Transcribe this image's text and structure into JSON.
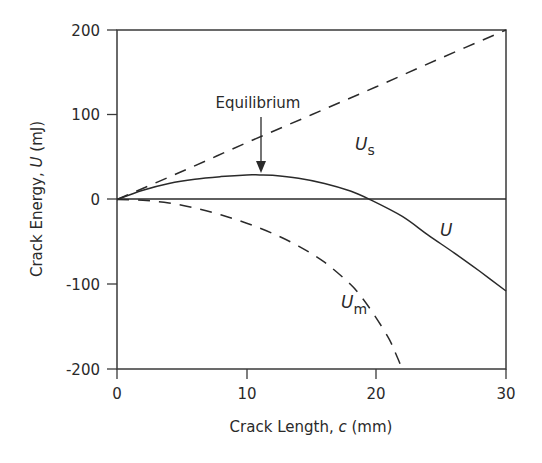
{
  "chart_data": {
    "type": "line",
    "title": "",
    "xlabel": "Crack Length, c (mm)",
    "ylabel": "Crack Energy, U (mJ)",
    "xlim": [
      0,
      30
    ],
    "ylim": [
      -200,
      200
    ],
    "xticks": [
      0,
      10,
      20,
      30
    ],
    "yticks": [
      200,
      100,
      0,
      -100,
      -200
    ],
    "grid": false,
    "legend": null,
    "series": [
      {
        "name": "U_s",
        "label_main": "U",
        "label_sub": "s",
        "style": "dashed",
        "x": [
          0,
          5,
          10,
          15,
          20,
          25,
          30
        ],
        "y": [
          0,
          33,
          67,
          100,
          133,
          167,
          200
        ]
      },
      {
        "name": "U",
        "label_main": "U",
        "label_sub": "",
        "style": "solid",
        "x": [
          0,
          2,
          4,
          6,
          8,
          10,
          11,
          12,
          14,
          16,
          18,
          19.5,
          22,
          24,
          26,
          28,
          30
        ],
        "y": [
          0,
          11,
          19,
          24,
          27,
          29,
          29,
          28.5,
          25,
          19,
          10,
          0,
          -20,
          -42,
          -63,
          -85,
          -108
        ]
      },
      {
        "name": "U_m",
        "label_main": "U",
        "label_sub": "m",
        "style": "dashed",
        "x": [
          0,
          2,
          4,
          6,
          8,
          10,
          12,
          14,
          16,
          18,
          19,
          20,
          21,
          21.5,
          22
        ],
        "y": [
          0,
          -1,
          -4,
          -10,
          -18,
          -28,
          -40,
          -55,
          -74,
          -100,
          -118,
          -140,
          -165,
          -182,
          -200
        ]
      }
    ],
    "annotations": [
      {
        "text": "Equilibrium",
        "x": 11,
        "y": 29,
        "arrow": true
      }
    ]
  },
  "labels": {
    "xlabel_pre": "Crack Length, ",
    "xlabel_var": "c",
    "xlabel_post": " (mm)",
    "ylabel_pre": "Crack Energy, ",
    "ylabel_var": "U",
    "ylabel_post": " (mJ)",
    "equilibrium": "Equilibrium",
    "us_main": "U",
    "us_sub": "s",
    "u_main": "U",
    "um_main": "U",
    "um_sub": "m",
    "xtick_0": "0",
    "xtick_1": "10",
    "xtick_2": "20",
    "xtick_3": "30",
    "ytick_0": "200",
    "ytick_1": "100",
    "ytick_2": "0",
    "ytick_3": "-100",
    "ytick_4": "-200"
  }
}
